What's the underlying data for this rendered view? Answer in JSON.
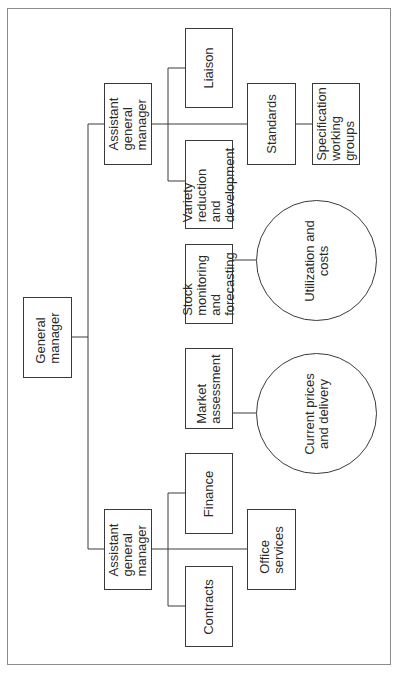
{
  "diagram": {
    "type": "org-chart",
    "orientation": "rotated-90-ccw",
    "nodes": {
      "general_manager": "General\nmanager",
      "agm_top": "Assistant\ngeneral\nmanager",
      "liaison": "Liaison",
      "variety": "Variety\nreduction and\ndevelopment",
      "standards": "Standards",
      "spec_groups": "Specification\nworking\ngroups",
      "stock": "Stock\nmonitoring and\nforecasting",
      "utilization": "Utilization  and\ncosts",
      "market": "Market\nassessment",
      "current_prices": "Current prices\nand delivery",
      "agm_bottom": "Assistant\ngeneral\nmanager",
      "finance": "Finance",
      "contracts": "Contracts",
      "office": "Office\nservices"
    },
    "edges": [
      [
        "General manager",
        "Assistant general manager (top)"
      ],
      [
        "General manager",
        "Stock monitoring and forecasting"
      ],
      [
        "General manager",
        "Market assessment"
      ],
      [
        "General manager",
        "Assistant general manager (bottom)"
      ],
      [
        "Assistant general manager (top)",
        "Liaison"
      ],
      [
        "Assistant general manager (top)",
        "Variety reduction and development"
      ],
      [
        "Assistant general manager (top)",
        "Standards"
      ],
      [
        "Standards",
        "Specification working groups"
      ],
      [
        "Stock monitoring and forecasting",
        "Utilization and costs"
      ],
      [
        "Market assessment",
        "Current prices and delivery"
      ],
      [
        "Assistant general manager (bottom)",
        "Finance"
      ],
      [
        "Assistant general manager (bottom)",
        "Contracts"
      ],
      [
        "Assistant general manager (bottom)",
        "Office services"
      ]
    ],
    "colors": {
      "line": "#3a3a3a",
      "frame": "#8c8c8c",
      "background": "#ffffff"
    }
  }
}
